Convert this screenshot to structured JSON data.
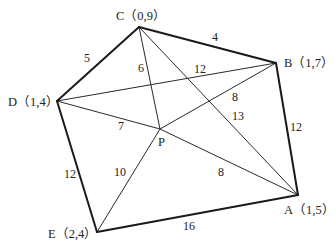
{
  "diagram": {
    "type": "weighted-graph",
    "vertices": [
      {
        "id": "C",
        "label": "C（0,9）",
        "x": 139,
        "y": 27,
        "lx": 116,
        "ly": 20
      },
      {
        "id": "B",
        "label": "B（1,7）",
        "x": 276,
        "y": 63,
        "lx": 284,
        "ly": 67
      },
      {
        "id": "D",
        "label": "D（1,4）",
        "x": 57,
        "y": 101,
        "lx": 8,
        "ly": 106
      },
      {
        "id": "P",
        "label": "P",
        "x": 160,
        "y": 129,
        "lx": 158,
        "ly": 146
      },
      {
        "id": "E",
        "label": "E（2,4）",
        "x": 97,
        "y": 232,
        "lx": 48,
        "ly": 238
      },
      {
        "id": "A",
        "label": "A（1,5）",
        "x": 298,
        "y": 195,
        "lx": 284,
        "ly": 214
      }
    ],
    "edges": [
      {
        "from": "C",
        "to": "B",
        "weight": "4",
        "style": "outer",
        "wx": 212,
        "wy": 41
      },
      {
        "from": "B",
        "to": "A",
        "weight": "12",
        "style": "outer",
        "wx": 290,
        "wy": 131
      },
      {
        "from": "A",
        "to": "E",
        "weight": "16",
        "style": "outer",
        "wx": 183,
        "wy": 230
      },
      {
        "from": "E",
        "to": "D",
        "weight": "12",
        "style": "outer",
        "wx": 64,
        "wy": 178
      },
      {
        "from": "D",
        "to": "C",
        "weight": "5",
        "style": "outer",
        "wx": 84,
        "wy": 62
      },
      {
        "from": "C",
        "to": "P",
        "weight": "6",
        "style": "inner",
        "wx": 138,
        "wy": 72
      },
      {
        "from": "D",
        "to": "B",
        "weight": "12",
        "style": "inner",
        "wx": 194,
        "wy": 73
      },
      {
        "from": "C",
        "to": "A",
        "weight": "13",
        "style": "inner",
        "wx": 232,
        "wy": 120
      },
      {
        "from": "P",
        "to": "B",
        "weight": "8",
        "style": "inner",
        "wx": 232,
        "wy": 101
      },
      {
        "from": "D",
        "to": "P",
        "weight": "7",
        "style": "inner",
        "wx": 118,
        "wy": 130
      },
      {
        "from": "P",
        "to": "A",
        "weight": "8",
        "style": "inner",
        "wx": 218,
        "wy": 176
      },
      {
        "from": "P",
        "to": "E",
        "weight": "10",
        "style": "inner",
        "wx": 114,
        "wy": 176
      }
    ]
  }
}
